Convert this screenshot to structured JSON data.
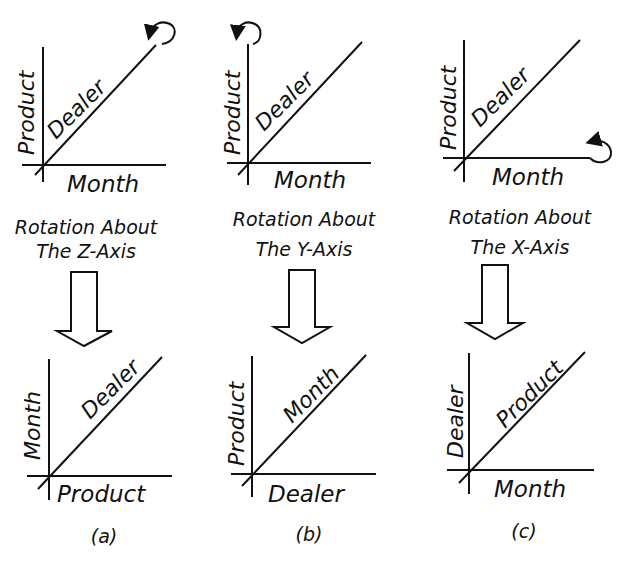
{
  "panels": [
    {
      "id": "a",
      "caption": "(a)",
      "rotation_text_line1": "Rotation About",
      "rotation_text_line2": "The Z-Axis",
      "before": {
        "vertical": "Product",
        "horizontal": "Month",
        "diagonal": "Dealer",
        "rotation_marker": "diagonal-end"
      },
      "after": {
        "vertical": "Month",
        "horizontal": "Product",
        "diagonal": "Dealer"
      }
    },
    {
      "id": "b",
      "caption": "(b)",
      "rotation_text_line1": "Rotation About",
      "rotation_text_line2": "The Y-Axis",
      "before": {
        "vertical": "Product",
        "horizontal": "Month",
        "diagonal": "Dealer",
        "rotation_marker": "vertical-end"
      },
      "after": {
        "vertical": "Product",
        "horizontal": "Dealer",
        "diagonal": "Month"
      }
    },
    {
      "id": "c",
      "caption": "(c)",
      "rotation_text_line1": "Rotation About",
      "rotation_text_line2": "The X-Axis",
      "before": {
        "vertical": "Product",
        "horizontal": "Month",
        "diagonal": "Dealer",
        "rotation_marker": "horizontal-end"
      },
      "after": {
        "vertical": "Dealer",
        "horizontal": "Month",
        "diagonal": "Product"
      }
    }
  ]
}
